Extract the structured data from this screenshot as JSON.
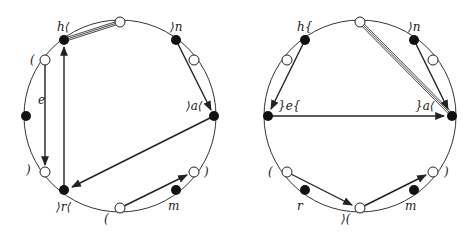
{
  "diagrams": [
    {
      "id": "left",
      "center": [
        120,
        116
      ],
      "radius": 96,
      "labels": [
        {
          "text": "h⟨",
          "x": 57,
          "y": 31
        },
        {
          "text": "⟩n",
          "x": 170,
          "y": 31
        },
        {
          "text": "(",
          "x": 30,
          "y": 64
        },
        {
          "text": "e",
          "x": 38,
          "y": 104
        },
        {
          "text": "⟩a⟨",
          "x": 186,
          "y": 110
        },
        {
          "text": ")",
          "x": 26,
          "y": 174
        },
        {
          "text": ")",
          "x": 204,
          "y": 176
        },
        {
          "text": "⟩r⟨",
          "x": 56,
          "y": 211
        },
        {
          "text": "m",
          "x": 168,
          "y": 210
        },
        {
          "text": "(",
          "x": 104,
          "y": 223
        }
      ],
      "filled_points": [
        [
          64,
          40
        ],
        [
          176,
          40
        ],
        [
          214,
          116
        ],
        [
          176,
          190
        ],
        [
          64,
          190
        ],
        [
          26,
          116
        ]
      ],
      "open_points": [
        [
          120,
          22
        ],
        [
          194,
          60
        ],
        [
          194,
          172
        ],
        [
          120,
          208
        ],
        [
          45,
          172
        ],
        [
          45,
          60
        ]
      ],
      "arrows": [
        {
          "from": [
            176,
            40
          ],
          "to": [
            211,
            110
          ]
        },
        {
          "from": [
            45,
            60
          ],
          "to": [
            45,
            165
          ]
        },
        {
          "from": [
            64,
            190
          ],
          "to": [
            64,
            47
          ]
        },
        {
          "from": [
            214,
            116
          ],
          "to": [
            72,
            187
          ]
        },
        {
          "from": [
            120,
            208
          ],
          "to": [
            187,
            175
          ]
        }
      ],
      "double_lines": [
        {
          "from": [
            64,
            40
          ],
          "to": [
            120,
            22
          ]
        }
      ]
    },
    {
      "id": "right",
      "center": [
        360,
        116
      ],
      "radius": 96,
      "labels": [
        {
          "text": "h{",
          "x": 297,
          "y": 31
        },
        {
          "text": "⟩n",
          "x": 408,
          "y": 31
        },
        {
          "text": "}e{",
          "x": 278,
          "y": 110
        },
        {
          "text": "}a⟨",
          "x": 415,
          "y": 110
        },
        {
          "text": "(",
          "x": 268,
          "y": 176
        },
        {
          "text": ")",
          "x": 444,
          "y": 176
        },
        {
          "text": "r",
          "x": 297,
          "y": 210
        },
        {
          "text": "⟩(",
          "x": 341,
          "y": 223
        },
        {
          "text": "m",
          "x": 405,
          "y": 210
        }
      ],
      "filled_points": [
        [
          305,
          40
        ],
        [
          414,
          40
        ],
        [
          268,
          116
        ],
        [
          452,
          116
        ],
        [
          305,
          190
        ],
        [
          414,
          190
        ]
      ],
      "open_points": [
        [
          360,
          22
        ],
        [
          287,
          60
        ],
        [
          433,
          60
        ],
        [
          287,
          172
        ],
        [
          433,
          172
        ],
        [
          360,
          208
        ]
      ],
      "arrows": [
        {
          "from": [
            305,
            40
          ],
          "to": [
            271,
            109
          ]
        },
        {
          "from": [
            414,
            40
          ],
          "to": [
            448,
            109
          ]
        },
        {
          "from": [
            268,
            116
          ],
          "to": [
            444,
            116
          ]
        },
        {
          "from": [
            287,
            172
          ],
          "to": [
            352,
            205
          ]
        },
        {
          "from": [
            360,
            208
          ],
          "to": [
            426,
            175
          ]
        }
      ],
      "double_lines": [
        {
          "from": [
            360,
            22
          ],
          "to": [
            450,
            113
          ]
        }
      ]
    }
  ]
}
